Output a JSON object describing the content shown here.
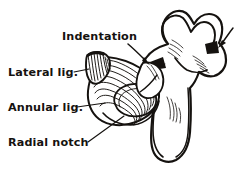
{
  "figure": {
    "background_color": "#ffffff",
    "ink_color": "#15120f",
    "width": 235,
    "height": 170
  },
  "labels": [
    {
      "id": "indentation",
      "text": "Indentation",
      "x": 62,
      "y": 40,
      "anchor": "start",
      "pointer_type": "arrow",
      "pointer_count": 2
    },
    {
      "id": "lateral-lig",
      "text": "Lateral lig.",
      "x": 8,
      "y": 76,
      "anchor": "start",
      "pointer_type": "leader-line",
      "pointer_count": 1
    },
    {
      "id": "annular-lig",
      "text": "Annular lig.",
      "x": 8,
      "y": 111,
      "anchor": "start",
      "pointer_type": "leader-line",
      "pointer_count": 1
    },
    {
      "id": "radial-notch",
      "text": "Radial notch",
      "x": 8,
      "y": 146,
      "anchor": "start",
      "pointer_type": "leader-line",
      "pointer_count": 1
    }
  ],
  "structures": [
    {
      "id": "olecranon",
      "name": "olecranon process"
    },
    {
      "id": "trochlear-notch",
      "name": "trochlear notch"
    },
    {
      "id": "coronoid-process",
      "name": "coronoid process"
    },
    {
      "id": "ulna-shaft",
      "name": "ulna shaft"
    },
    {
      "id": "annular-ligament-ring",
      "name": "annular ligament ring",
      "fiber_bands": 8
    },
    {
      "id": "lateral-ligament-fan",
      "name": "lateral collateral ligament fan",
      "fiber_bands": 9
    },
    {
      "id": "radial-notch-surface",
      "name": "radial notch articular surface"
    }
  ]
}
